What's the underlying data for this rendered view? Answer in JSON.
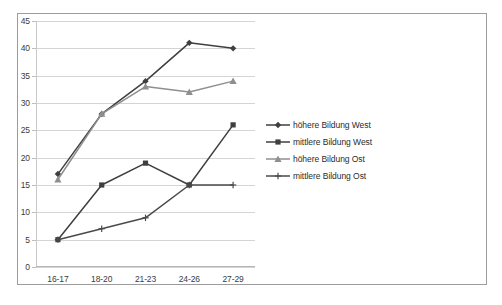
{
  "chart_data": {
    "type": "line",
    "title": "",
    "subtitle": "",
    "xlabel": "",
    "ylabel": "",
    "categories": [
      "16-17",
      "18-20",
      "21-23",
      "24-26",
      "27-29"
    ],
    "ylim": [
      0,
      45
    ],
    "ytick_step": 5,
    "yticks": [
      "0",
      "5",
      "10",
      "15",
      "20",
      "25",
      "30",
      "35",
      "40",
      "45"
    ],
    "grid": "horizontal",
    "legend_position": "right",
    "series": [
      {
        "name": "höhere Bildung West",
        "values": [
          17,
          28,
          34,
          41,
          40
        ],
        "color": "#3f3f3f",
        "marker": "diamond"
      },
      {
        "name": "mittlere Bildung West",
        "values": [
          5,
          15,
          19,
          15,
          26
        ],
        "color": "#3f3f3f",
        "marker": "square"
      },
      {
        "name": "höhere Bildung Ost",
        "values": [
          16,
          28,
          33,
          32,
          34
        ],
        "color": "#8f8f8f",
        "marker": "triangle"
      },
      {
        "name": "mittlere Bildung Ost",
        "values": [
          5,
          7,
          9,
          15,
          15
        ],
        "color": "#4a4a4a",
        "marker": "cross"
      }
    ]
  },
  "legend": {
    "items": [
      {
        "label": "höhere Bildung West"
      },
      {
        "label": "mittlere Bildung West"
      },
      {
        "label": "höhere Bildung Ost"
      },
      {
        "label": "mittlere Bildung Ost"
      }
    ]
  },
  "colors": {
    "series_west_dark": "#3f3f3f",
    "series_ost_gray": "#8f8f8f",
    "gridline": "#d4d4d4",
    "frame_border": "#9c9c9c",
    "text": "#2b2b2b"
  }
}
